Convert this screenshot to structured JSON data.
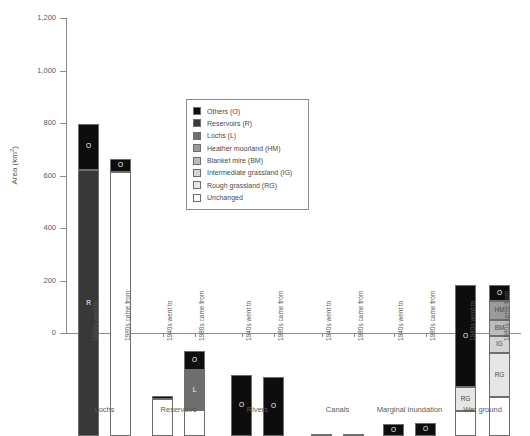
{
  "chart_data": {
    "type": "bar",
    "title": "",
    "xlabel": "",
    "ylabel": "Area (km2)",
    "ylabel_main": "Area (km",
    "ylabel_sup": "2",
    "ylabel_tail": ")",
    "ylim": [
      0,
      1200
    ],
    "yticks": [
      0,
      200,
      400,
      600,
      800,
      1000,
      1200
    ],
    "ytick_labels": [
      "0",
      "200",
      "400",
      "600",
      "800",
      "1,000",
      "1,200"
    ],
    "grid": false,
    "stacked": true,
    "legend_position": "inside-upper-center",
    "categories": [
      "1940s went to",
      "1980s came from",
      "1940s went to",
      "1980s came from",
      "1940s went to",
      "1980s came from",
      "1940s went to",
      "1980s came from",
      "1940s went to",
      "1980s came from",
      "1940s went to",
      "1980s came from"
    ],
    "groups": [
      {
        "label": "Lochs",
        "bars": [
          0,
          1
        ]
      },
      {
        "label": "Reservoirs",
        "bars": [
          2,
          3
        ]
      },
      {
        "label": "Rivers",
        "bars": [
          4,
          5
        ]
      },
      {
        "label": "Canals",
        "bars": [
          6,
          7
        ]
      },
      {
        "label": "Marginal inundation",
        "bars": [
          8,
          9
        ]
      },
      {
        "label": "Wet ground",
        "bars": [
          10,
          11
        ]
      }
    ],
    "series": [
      {
        "name": "Others (O)",
        "code": "O",
        "color": "#0d0d0d",
        "values": [
          175,
          50,
          12,
          72,
          232,
          225,
          8,
          5,
          45,
          48,
          388,
          62
        ]
      },
      {
        "name": "Reservoirs (R)",
        "code": "R",
        "color": "#383838",
        "values": [
          1015,
          0,
          0,
          0,
          0,
          0,
          0,
          0,
          0,
          0,
          0,
          0
        ]
      },
      {
        "name": "Lochs (L)",
        "code": "L",
        "color": "#6e6e6e",
        "values": [
          0,
          0,
          0,
          155,
          0,
          0,
          0,
          0,
          0,
          0,
          0,
          0
        ]
      },
      {
        "name": "Heather moorland (HM)",
        "code": "HM",
        "color": "#9a9a9a",
        "values": [
          0,
          0,
          0,
          0,
          0,
          0,
          0,
          0,
          0,
          0,
          0,
          72
        ]
      },
      {
        "name": "Blanket mire (BM)",
        "code": "BM",
        "color": "#bcbcbc",
        "values": [
          0,
          0,
          0,
          0,
          0,
          0,
          0,
          0,
          0,
          0,
          0,
          62
        ]
      },
      {
        "name": "Intermediate grassland (IG)",
        "code": "IG",
        "color": "#d4d4d4",
        "values": [
          0,
          0,
          0,
          0,
          0,
          0,
          0,
          0,
          0,
          0,
          0,
          62
        ]
      },
      {
        "name": "Rough grassland (RG)",
        "code": "RG",
        "color": "#e6e6e6",
        "values": [
          0,
          0,
          0,
          0,
          0,
          0,
          0,
          0,
          0,
          0,
          92,
          170
        ]
      },
      {
        "name": "Unchanged",
        "code": "U",
        "color": "#ffffff",
        "values": [
          0,
          1005,
          140,
          98,
          0,
          0,
          0,
          0,
          0,
          0,
          95,
          148
        ]
      }
    ],
    "bar_totals": [
      1190,
      1055,
      152,
      325,
      232,
      225,
      8,
      5,
      45,
      48,
      575,
      576
    ]
  },
  "legend": {
    "items": [
      {
        "label": "Others (O)",
        "color": "#0d0d0d"
      },
      {
        "label": "Reservoirs (R)",
        "color": "#383838"
      },
      {
        "label": "Lochs (L)",
        "color": "#6e6e6e"
      },
      {
        "label": "Heather moorland (HM)",
        "color": "#9a9a9a"
      },
      {
        "label": "Blanket mire (BM)",
        "color": "#bcbcbc"
      },
      {
        "label": "Intermediate grassland (IG)",
        "color": "#d4d4d4"
      },
      {
        "label": "Rough grassland (RG)",
        "color": "#e6e6e6"
      },
      {
        "label": "Unchanged",
        "color": "#ffffff"
      }
    ]
  }
}
